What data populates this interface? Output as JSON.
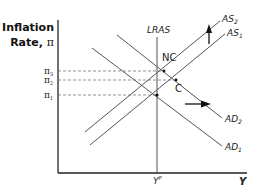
{
  "diagram": {
    "y_axis": {
      "title_line1": "Inflation",
      "title_line2": "Rate,",
      "title_symbol": "π"
    },
    "x_axis": {
      "label": "Y",
      "tick_label_main": "Y",
      "tick_label_sup": "P"
    },
    "curves": {
      "lras": {
        "label": "LRAS"
      },
      "as2": {
        "label": "AS",
        "sub": "2"
      },
      "as1": {
        "label": "AS",
        "sub": "1"
      },
      "ad2": {
        "label": "AD",
        "sub": "2"
      },
      "ad1": {
        "label": "AD",
        "sub": "1"
      }
    },
    "levels": [
      {
        "label": "π",
        "sub": "3"
      },
      {
        "label": "π",
        "sub": "2"
      },
      {
        "label": "π",
        "sub": "1"
      }
    ],
    "points": {
      "nc": "NC",
      "c": "C"
    },
    "arrows": {
      "as_shift": "up",
      "ad_shift": "right"
    },
    "colors": {
      "line": "#555555",
      "axis": "#222222",
      "dash": "#777777",
      "arrow": "#111111"
    }
  }
}
